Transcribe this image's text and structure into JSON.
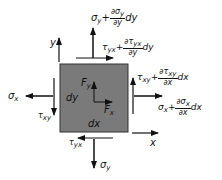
{
  "diagram": {
    "type": "stress-element-free-body-diagram",
    "element_color": "#7a7a7a",
    "border_color": "#333333",
    "axes": {
      "x_label": "x",
      "y_label": "y"
    },
    "element_labels": {
      "width": "dx",
      "height": "dy"
    },
    "body_forces": {
      "fx": {
        "sym": "F",
        "sub": "x"
      },
      "fy": {
        "sym": "F",
        "sub": "y"
      }
    },
    "stresses": {
      "sigma_x": {
        "sym": "σ",
        "sub": "x"
      },
      "tau_xy": {
        "sym": "τ",
        "sub": "xy"
      },
      "sigma_y": {
        "sym": "σ",
        "sub": "y"
      },
      "tau_yx": {
        "sym": "τ",
        "sub": "yx"
      },
      "sigma_y_top": {
        "base": "σ",
        "base_sub": "y",
        "plus": "+",
        "num": "∂σ",
        "num_sub": "y",
        "den": "∂y",
        "diff": "dy"
      },
      "tau_yx_top": {
        "base": "τ",
        "base_sub": "yx",
        "plus": "+",
        "num": "∂τ",
        "num_sub": "yx",
        "den": "∂y",
        "diff": "dy"
      },
      "tau_xy_right": {
        "base": "τ",
        "base_sub": "xy",
        "plus": "+",
        "num": "∂τ",
        "num_sub": "xy",
        "den": "∂x",
        "diff": "dx"
      },
      "sigma_x_right": {
        "base": "σ",
        "base_sub": "x",
        "plus": "+",
        "num": "∂σ",
        "num_sub": "x",
        "den": "∂x",
        "diff": "dx"
      }
    }
  }
}
